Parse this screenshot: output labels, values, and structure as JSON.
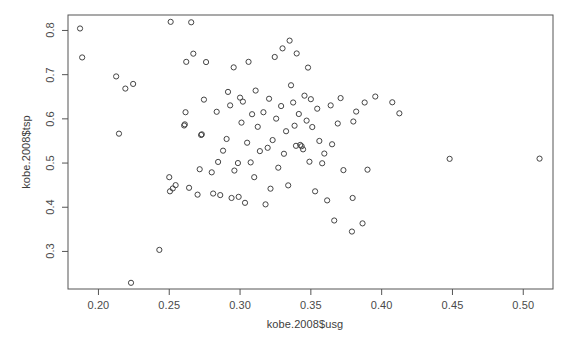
{
  "chart_data": {
    "type": "scatter",
    "title": "",
    "xlabel": "kobe.2008$usg",
    "ylabel": "kobe.2008$tsp",
    "xlim": [
      0.1785,
      0.521
    ],
    "ylim": [
      0.215,
      0.835
    ],
    "grid": false,
    "legend": null,
    "marker": {
      "shape": "open-circle",
      "radius_px": 2.6,
      "stroke": "#444444",
      "fill": "none",
      "stroke_width": 1.0
    },
    "xticks": [
      0.2,
      0.25,
      0.3,
      0.35,
      0.4,
      0.45,
      0.5
    ],
    "xtick_labels": [
      "0.20",
      "0.25",
      "0.30",
      "0.35",
      "0.40",
      "0.45",
      "0.50"
    ],
    "yticks": [
      0.3,
      0.4,
      0.5,
      0.6,
      0.7,
      0.8
    ],
    "ytick_labels": [
      "0.3",
      "0.4",
      "0.5",
      "0.6",
      "0.7",
      "0.8"
    ],
    "n_points": 105,
    "points": [
      [
        0.187,
        0.8045
      ],
      [
        0.1885,
        0.739
      ],
      [
        0.2125,
        0.696
      ],
      [
        0.2145,
        0.5665
      ],
      [
        0.219,
        0.6685
      ],
      [
        0.223,
        0.229
      ],
      [
        0.2245,
        0.679
      ],
      [
        0.243,
        0.3035
      ],
      [
        0.25,
        0.468
      ],
      [
        0.2505,
        0.436
      ],
      [
        0.251,
        0.8195
      ],
      [
        0.2525,
        0.4425
      ],
      [
        0.2545,
        0.45
      ],
      [
        0.2605,
        0.585
      ],
      [
        0.261,
        0.5875
      ],
      [
        0.2615,
        0.615
      ],
      [
        0.262,
        0.729
      ],
      [
        0.264,
        0.444
      ],
      [
        0.2655,
        0.8185
      ],
      [
        0.267,
        0.7475
      ],
      [
        0.27,
        0.4285
      ],
      [
        0.2715,
        0.486
      ],
      [
        0.2725,
        0.5635
      ],
      [
        0.273,
        0.565
      ],
      [
        0.2745,
        0.6435
      ],
      [
        0.276,
        0.7285
      ],
      [
        0.28,
        0.479
      ],
      [
        0.281,
        0.431
      ],
      [
        0.2835,
        0.616
      ],
      [
        0.2845,
        0.5025
      ],
      [
        0.286,
        0.4275
      ],
      [
        0.288,
        0.528
      ],
      [
        0.2905,
        0.5545
      ],
      [
        0.2915,
        0.661
      ],
      [
        0.293,
        0.6305
      ],
      [
        0.294,
        0.421
      ],
      [
        0.2955,
        0.7165
      ],
      [
        0.296,
        0.483
      ],
      [
        0.2985,
        0.5
      ],
      [
        0.299,
        0.4235
      ],
      [
        0.3,
        0.648
      ],
      [
        0.301,
        0.5915
      ],
      [
        0.302,
        0.639
      ],
      [
        0.3035,
        0.41
      ],
      [
        0.305,
        0.546
      ],
      [
        0.306,
        0.729
      ],
      [
        0.3075,
        0.5015
      ],
      [
        0.3085,
        0.6105
      ],
      [
        0.31,
        0.468
      ],
      [
        0.311,
        0.664
      ],
      [
        0.3125,
        0.582
      ],
      [
        0.314,
        0.527
      ],
      [
        0.3165,
        0.615
      ],
      [
        0.318,
        0.4065
      ],
      [
        0.3195,
        0.5345
      ],
      [
        0.3205,
        0.6455
      ],
      [
        0.3215,
        0.442
      ],
      [
        0.323,
        0.552
      ],
      [
        0.3245,
        0.74
      ],
      [
        0.3255,
        0.6005
      ],
      [
        0.327,
        0.4895
      ],
      [
        0.329,
        0.629
      ],
      [
        0.33,
        0.7595
      ],
      [
        0.331,
        0.521
      ],
      [
        0.3325,
        0.572
      ],
      [
        0.334,
        0.4495
      ],
      [
        0.335,
        0.777
      ],
      [
        0.336,
        0.676
      ],
      [
        0.3375,
        0.637
      ],
      [
        0.3385,
        0.5845
      ],
      [
        0.3395,
        0.539
      ],
      [
        0.34,
        0.748
      ],
      [
        0.3415,
        0.611
      ],
      [
        0.3425,
        0.541
      ],
      [
        0.3435,
        0.538
      ],
      [
        0.3445,
        0.531
      ],
      [
        0.3455,
        0.6525
      ],
      [
        0.347,
        0.596
      ],
      [
        0.348,
        0.716
      ],
      [
        0.349,
        0.503
      ],
      [
        0.35,
        0.6445
      ],
      [
        0.351,
        0.5815
      ],
      [
        0.353,
        0.436
      ],
      [
        0.3545,
        0.623
      ],
      [
        0.356,
        0.55
      ],
      [
        0.358,
        0.4995
      ],
      [
        0.3595,
        0.5215
      ],
      [
        0.3615,
        0.4155
      ],
      [
        0.364,
        0.6305
      ],
      [
        0.365,
        0.5425
      ],
      [
        0.3665,
        0.37
      ],
      [
        0.369,
        0.5895
      ],
      [
        0.371,
        0.647
      ],
      [
        0.373,
        0.484
      ],
      [
        0.379,
        0.345
      ],
      [
        0.3795,
        0.421
      ],
      [
        0.38,
        0.594
      ],
      [
        0.382,
        0.6165
      ],
      [
        0.3865,
        0.3635
      ],
      [
        0.388,
        0.637
      ],
      [
        0.39,
        0.485
      ],
      [
        0.3955,
        0.6505
      ],
      [
        0.4075,
        0.6375
      ],
      [
        0.4125,
        0.6125
      ],
      [
        0.448,
        0.5095
      ],
      [
        0.5115,
        0.51
      ]
    ]
  },
  "axes": {
    "box_stroke": "#555555",
    "box_px": {
      "left": 68,
      "top": 15,
      "right": 553,
      "bottom": 289
    }
  }
}
